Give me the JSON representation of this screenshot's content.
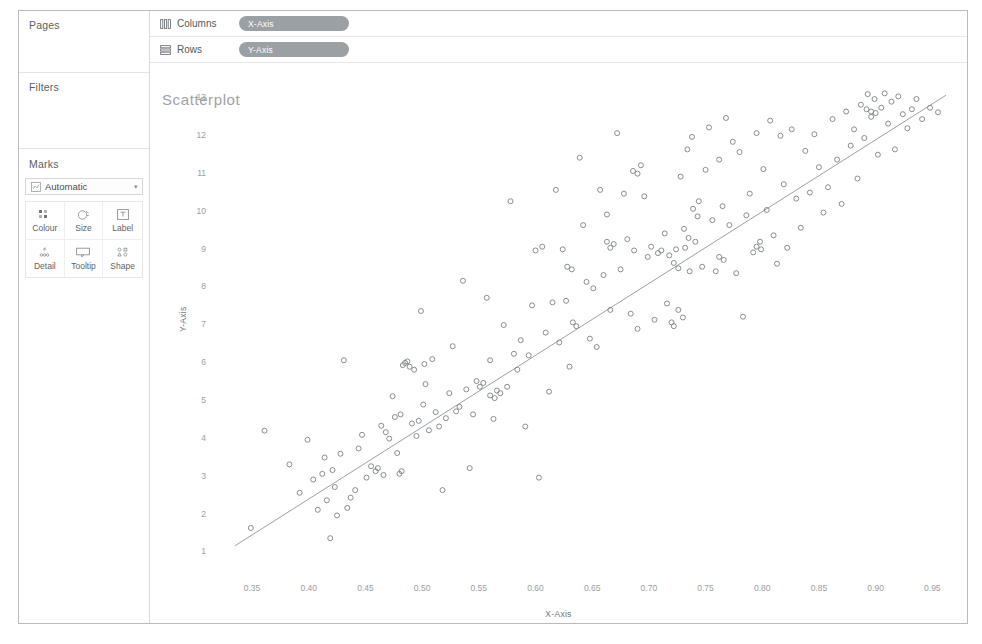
{
  "app": {
    "sidebar": {
      "cards": [
        {
          "id": "pages",
          "title": "Pages"
        },
        {
          "id": "filters",
          "title": "Filters"
        },
        {
          "id": "marks",
          "title": "Marks"
        }
      ],
      "mark_type": {
        "label": "Automatic",
        "icon": "mark-type-icon",
        "caret": "▾"
      },
      "mark_buttons": [
        {
          "label": "Colour",
          "icon": "colour-icon"
        },
        {
          "label": "Size",
          "icon": "size-icon"
        },
        {
          "label": "Label",
          "icon": "label-icon"
        },
        {
          "label": "Detail",
          "icon": "detail-icon"
        },
        {
          "label": "Tooltip",
          "icon": "tooltip-icon"
        },
        {
          "label": "Shape",
          "icon": "shape-icon"
        }
      ]
    },
    "shelves": [
      {
        "id": "columns",
        "label": "Columns",
        "icon": "columns-icon",
        "pill": "X-Axis"
      },
      {
        "id": "rows",
        "label": "Rows",
        "icon": "rows-icon",
        "pill": "Y-Axis"
      }
    ],
    "colors": {
      "pill_background": "#9ba0a5",
      "pill_text": "#ffffff",
      "frame_border": "#b9bcbf",
      "title_text": "#9ea3a8",
      "mark_stroke": "#7c8186",
      "trend_line": "#9aa0a6"
    }
  },
  "chart_data": {
    "type": "scatter",
    "title": "Scatterplot",
    "xlabel": "X-Axis",
    "ylabel": "Y-Axis",
    "xlim": [
      0.32,
      0.97
    ],
    "ylim": [
      0.8,
      13.4
    ],
    "grid": false,
    "legend": null,
    "xticks": [
      0.35,
      0.4,
      0.45,
      0.5,
      0.55,
      0.6,
      0.65,
      0.7,
      0.75,
      0.8,
      0.85,
      0.9,
      0.95
    ],
    "xticklabels": [
      "0.35",
      "0.40",
      "0.45",
      "0.50",
      "0.55",
      "0.60",
      "0.65",
      "0.70",
      "0.75",
      "0.80",
      "0.85",
      "0.90",
      "0.95"
    ],
    "yticks": [
      1,
      2,
      3,
      4,
      5,
      6,
      7,
      8,
      9,
      10,
      11,
      12,
      13
    ],
    "yticklabels": [
      "1",
      "2",
      "3",
      "4",
      "5",
      "6",
      "7",
      "8",
      "9",
      "10",
      "11",
      "12",
      "13"
    ],
    "marker": "open-circle",
    "marker_size": 5,
    "trendline": {
      "type": "linear",
      "x": [
        0.335,
        0.962
      ],
      "y": [
        1.15,
        13.05
      ]
    },
    "points": [
      [
        0.349,
        1.62
      ],
      [
        0.361,
        4.19
      ],
      [
        0.383,
        3.3
      ],
      [
        0.392,
        2.55
      ],
      [
        0.399,
        3.95
      ],
      [
        0.404,
        2.9
      ],
      [
        0.408,
        2.1
      ],
      [
        0.412,
        3.05
      ],
      [
        0.414,
        3.48
      ],
      [
        0.416,
        2.35
      ],
      [
        0.419,
        1.35
      ],
      [
        0.421,
        3.15
      ],
      [
        0.423,
        2.7
      ],
      [
        0.425,
        1.95
      ],
      [
        0.428,
        3.58
      ],
      [
        0.431,
        6.05
      ],
      [
        0.434,
        2.15
      ],
      [
        0.437,
        2.42
      ],
      [
        0.441,
        2.62
      ],
      [
        0.444,
        3.72
      ],
      [
        0.447,
        4.08
      ],
      [
        0.451,
        2.95
      ],
      [
        0.455,
        3.25
      ],
      [
        0.459,
        3.12
      ],
      [
        0.461,
        3.2
      ],
      [
        0.464,
        4.32
      ],
      [
        0.468,
        4.15
      ],
      [
        0.471,
        3.98
      ],
      [
        0.474,
        5.1
      ],
      [
        0.476,
        4.55
      ],
      [
        0.478,
        3.6
      ],
      [
        0.481,
        4.62
      ],
      [
        0.483,
        5.92
      ],
      [
        0.485,
        5.98
      ],
      [
        0.487,
        6.02
      ],
      [
        0.489,
        5.88
      ],
      [
        0.491,
        4.38
      ],
      [
        0.493,
        5.8
      ],
      [
        0.495,
        4.05
      ],
      [
        0.497,
        4.45
      ],
      [
        0.499,
        7.35
      ],
      [
        0.501,
        4.88
      ],
      [
        0.503,
        5.42
      ],
      [
        0.506,
        4.2
      ],
      [
        0.509,
        6.08
      ],
      [
        0.512,
        4.68
      ],
      [
        0.515,
        4.3
      ],
      [
        0.518,
        2.62
      ],
      [
        0.521,
        4.52
      ],
      [
        0.524,
        5.18
      ],
      [
        0.527,
        6.42
      ],
      [
        0.53,
        4.7
      ],
      [
        0.533,
        4.82
      ],
      [
        0.536,
        8.15
      ],
      [
        0.539,
        5.28
      ],
      [
        0.542,
        3.2
      ],
      [
        0.545,
        4.62
      ],
      [
        0.548,
        5.5
      ],
      [
        0.551,
        5.35
      ],
      [
        0.554,
        5.45
      ],
      [
        0.557,
        7.7
      ],
      [
        0.56,
        6.05
      ],
      [
        0.563,
        4.5
      ],
      [
        0.566,
        5.25
      ],
      [
        0.569,
        5.18
      ],
      [
        0.572,
        6.98
      ],
      [
        0.575,
        5.35
      ],
      [
        0.578,
        10.25
      ],
      [
        0.581,
        6.22
      ],
      [
        0.584,
        5.8
      ],
      [
        0.587,
        6.58
      ],
      [
        0.591,
        4.3
      ],
      [
        0.594,
        6.18
      ],
      [
        0.597,
        7.5
      ],
      [
        0.6,
        8.95
      ],
      [
        0.603,
        2.95
      ],
      [
        0.606,
        9.05
      ],
      [
        0.609,
        6.78
      ],
      [
        0.612,
        5.22
      ],
      [
        0.615,
        7.58
      ],
      [
        0.618,
        10.55
      ],
      [
        0.621,
        6.52
      ],
      [
        0.624,
        8.98
      ],
      [
        0.627,
        7.62
      ],
      [
        0.63,
        5.88
      ],
      [
        0.633,
        7.05
      ],
      [
        0.636,
        6.95
      ],
      [
        0.639,
        11.4
      ],
      [
        0.642,
        9.62
      ],
      [
        0.645,
        8.12
      ],
      [
        0.648,
        6.62
      ],
      [
        0.651,
        7.95
      ],
      [
        0.654,
        6.4
      ],
      [
        0.657,
        10.55
      ],
      [
        0.66,
        8.3
      ],
      [
        0.663,
        9.9
      ],
      [
        0.666,
        7.38
      ],
      [
        0.669,
        9.12
      ],
      [
        0.672,
        12.05
      ],
      [
        0.675,
        8.45
      ],
      [
        0.678,
        10.45
      ],
      [
        0.681,
        9.25
      ],
      [
        0.684,
        7.28
      ],
      [
        0.687,
        8.95
      ],
      [
        0.69,
        6.88
      ],
      [
        0.693,
        11.2
      ],
      [
        0.696,
        10.38
      ],
      [
        0.699,
        8.78
      ],
      [
        0.702,
        9.05
      ],
      [
        0.705,
        7.12
      ],
      [
        0.708,
        8.88
      ],
      [
        0.711,
        8.95
      ],
      [
        0.714,
        9.4
      ],
      [
        0.716,
        7.55
      ],
      [
        0.718,
        8.82
      ],
      [
        0.72,
        7.05
      ],
      [
        0.722,
        6.95
      ],
      [
        0.724,
        8.98
      ],
      [
        0.726,
        7.38
      ],
      [
        0.728,
        10.9
      ],
      [
        0.73,
        7.18
      ],
      [
        0.732,
        9.02
      ],
      [
        0.734,
        11.62
      ],
      [
        0.736,
        8.4
      ],
      [
        0.738,
        11.95
      ],
      [
        0.741,
        9.18
      ],
      [
        0.744,
        10.25
      ],
      [
        0.747,
        8.52
      ],
      [
        0.75,
        11.08
      ],
      [
        0.753,
        12.2
      ],
      [
        0.756,
        9.75
      ],
      [
        0.759,
        8.4
      ],
      [
        0.762,
        11.35
      ],
      [
        0.765,
        10.12
      ],
      [
        0.768,
        12.45
      ],
      [
        0.771,
        9.62
      ],
      [
        0.774,
        11.82
      ],
      [
        0.777,
        8.35
      ],
      [
        0.78,
        11.55
      ],
      [
        0.783,
        7.2
      ],
      [
        0.786,
        9.88
      ],
      [
        0.789,
        10.45
      ],
      [
        0.792,
        8.9
      ],
      [
        0.795,
        12.05
      ],
      [
        0.798,
        9.18
      ],
      [
        0.801,
        11.1
      ],
      [
        0.804,
        10.02
      ],
      [
        0.807,
        12.38
      ],
      [
        0.81,
        9.35
      ],
      [
        0.813,
        8.6
      ],
      [
        0.816,
        11.98
      ],
      [
        0.819,
        10.7
      ],
      [
        0.822,
        9.02
      ],
      [
        0.826,
        12.15
      ],
      [
        0.83,
        10.32
      ],
      [
        0.834,
        9.55
      ],
      [
        0.838,
        11.58
      ],
      [
        0.842,
        10.48
      ],
      [
        0.846,
        12.02
      ],
      [
        0.85,
        11.15
      ],
      [
        0.854,
        9.95
      ],
      [
        0.858,
        10.62
      ],
      [
        0.862,
        12.42
      ],
      [
        0.866,
        11.35
      ],
      [
        0.87,
        10.18
      ],
      [
        0.874,
        12.62
      ],
      [
        0.878,
        11.72
      ],
      [
        0.881,
        12.15
      ],
      [
        0.884,
        10.85
      ],
      [
        0.887,
        12.8
      ],
      [
        0.89,
        11.92
      ],
      [
        0.893,
        13.08
      ],
      [
        0.896,
        12.48
      ],
      [
        0.899,
        12.95
      ],
      [
        0.902,
        11.48
      ],
      [
        0.905,
        12.72
      ],
      [
        0.908,
        13.1
      ],
      [
        0.911,
        12.3
      ],
      [
        0.914,
        12.88
      ],
      [
        0.917,
        11.62
      ],
      [
        0.92,
        13.02
      ],
      [
        0.924,
        12.55
      ],
      [
        0.928,
        12.18
      ],
      [
        0.932,
        12.68
      ],
      [
        0.936,
        12.95
      ],
      [
        0.941,
        12.42
      ],
      [
        0.948,
        12.72
      ],
      [
        0.955,
        12.6
      ],
      [
        0.48,
        3.05
      ],
      [
        0.482,
        3.12
      ],
      [
        0.466,
        3.02
      ],
      [
        0.502,
        5.95
      ],
      [
        0.663,
        9.18
      ],
      [
        0.666,
        9.02
      ],
      [
        0.722,
        8.62
      ],
      [
        0.726,
        8.48
      ],
      [
        0.731,
        9.52
      ],
      [
        0.735,
        9.28
      ],
      [
        0.739,
        10.05
      ],
      [
        0.743,
        9.85
      ],
      [
        0.892,
        12.68
      ],
      [
        0.896,
        12.62
      ],
      [
        0.9,
        12.58
      ],
      [
        0.795,
        9.05
      ],
      [
        0.799,
        8.98
      ],
      [
        0.762,
        8.78
      ],
      [
        0.766,
        8.7
      ],
      [
        0.628,
        8.52
      ],
      [
        0.632,
        8.45
      ],
      [
        0.56,
        5.12
      ],
      [
        0.564,
        5.05
      ],
      [
        0.686,
        11.05
      ],
      [
        0.69,
        10.98
      ]
    ]
  }
}
